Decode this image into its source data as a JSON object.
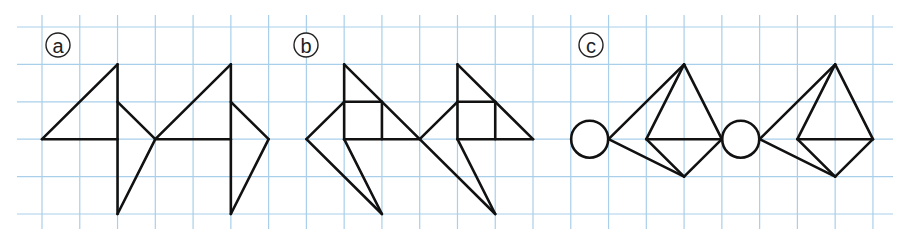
{
  "grid": {
    "origin_x": 42,
    "origin_y": 27,
    "cell_w": 37.77,
    "cell_h": 37.4,
    "cols": 23,
    "rows": 6,
    "h_line_x_start": 17,
    "h_line_x_end": 893,
    "v_line_y_start": 15,
    "v_line_y_end": 229,
    "line_color": "#a9cfea"
  },
  "stroke_color": "#111111",
  "figures": [
    {
      "id": "a",
      "label": "a",
      "label_pos": [
        58,
        45
      ],
      "segments": [
        [
          [
            0,
            3
          ],
          [
            2,
            1
          ]
        ],
        [
          [
            2,
            1
          ],
          [
            2,
            5
          ]
        ],
        [
          [
            0,
            3
          ],
          [
            2,
            3
          ]
        ],
        [
          [
            2,
            2
          ],
          [
            3,
            3
          ]
        ],
        [
          [
            3,
            3
          ],
          [
            2,
            5
          ]
        ],
        [
          [
            3,
            3
          ],
          [
            5,
            1
          ]
        ],
        [
          [
            5,
            1
          ],
          [
            5,
            5
          ]
        ],
        [
          [
            3,
            3
          ],
          [
            5,
            3
          ]
        ],
        [
          [
            5,
            2
          ],
          [
            6,
            3
          ]
        ],
        [
          [
            6,
            3
          ],
          [
            5,
            5
          ]
        ]
      ],
      "circles": []
    },
    {
      "id": "b",
      "label": "b",
      "label_pos": [
        306,
        45
      ],
      "segments": [
        [
          [
            8,
            1
          ],
          [
            8,
            3
          ]
        ],
        [
          [
            8,
            1
          ],
          [
            10,
            3
          ]
        ],
        [
          [
            8,
            2
          ],
          [
            9,
            2
          ]
        ],
        [
          [
            9,
            2
          ],
          [
            9,
            3
          ]
        ],
        [
          [
            8,
            3
          ],
          [
            10,
            3
          ]
        ],
        [
          [
            7,
            3
          ],
          [
            8,
            2
          ]
        ],
        [
          [
            7,
            3
          ],
          [
            9,
            5
          ]
        ],
        [
          [
            8,
            3
          ],
          [
            9,
            5
          ]
        ],
        [
          [
            11,
            1
          ],
          [
            11,
            3
          ]
        ],
        [
          [
            11,
            1
          ],
          [
            13,
            3
          ]
        ],
        [
          [
            11,
            2
          ],
          [
            12,
            2
          ]
        ],
        [
          [
            12,
            2
          ],
          [
            12,
            3
          ]
        ],
        [
          [
            11,
            3
          ],
          [
            13,
            3
          ]
        ],
        [
          [
            10,
            3
          ],
          [
            11,
            2
          ]
        ],
        [
          [
            10,
            3
          ],
          [
            12,
            5
          ]
        ],
        [
          [
            11,
            3
          ],
          [
            12,
            5
          ]
        ]
      ],
      "circles": []
    },
    {
      "id": "c",
      "label": "c",
      "label_pos": [
        591,
        45
      ],
      "segments": [
        [
          [
            15,
            3
          ],
          [
            17,
            1
          ]
        ],
        [
          [
            15,
            3
          ],
          [
            17,
            4
          ]
        ],
        [
          [
            16,
            3
          ],
          [
            17,
            1
          ]
        ],
        [
          [
            16,
            3
          ],
          [
            18,
            3
          ]
        ],
        [
          [
            17,
            1
          ],
          [
            18,
            3
          ]
        ],
        [
          [
            16,
            3
          ],
          [
            17,
            4
          ]
        ],
        [
          [
            17,
            4
          ],
          [
            18,
            3
          ]
        ],
        [
          [
            19,
            3
          ],
          [
            21,
            1
          ]
        ],
        [
          [
            19,
            3
          ],
          [
            21,
            4
          ]
        ],
        [
          [
            20,
            3
          ],
          [
            21,
            1
          ]
        ],
        [
          [
            20,
            3
          ],
          [
            22,
            3
          ]
        ],
        [
          [
            21,
            1
          ],
          [
            22,
            3
          ]
        ],
        [
          [
            20,
            3
          ],
          [
            21,
            4
          ]
        ],
        [
          [
            21,
            4
          ],
          [
            22,
            3
          ]
        ]
      ],
      "circles": [
        {
          "center": [
            14.5,
            3
          ],
          "radius": 0.49
        },
        {
          "center": [
            18.5,
            3
          ],
          "radius": 0.49
        }
      ]
    }
  ]
}
